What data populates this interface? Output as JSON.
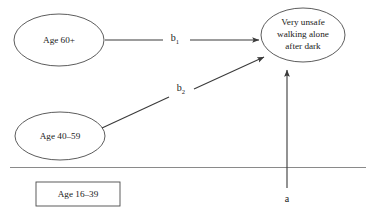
{
  "diagram": {
    "type": "path-diagram",
    "background_color": "#ffffff",
    "stroke_color": "#4a4a4a",
    "text_color": "#1a1a1a",
    "nodes": [
      {
        "id": "age-60-plus",
        "shape": "ellipse",
        "label": "Age 60+",
        "lines": [
          "Age 60+"
        ]
      },
      {
        "id": "age-40-59",
        "shape": "ellipse",
        "label": "Age 40–59",
        "lines": [
          "Age 40–59"
        ]
      },
      {
        "id": "age-16-39",
        "shape": "rectangle",
        "label": "Age 16–39",
        "lines": [
          "Age 16–39"
        ]
      },
      {
        "id": "outcome",
        "shape": "ellipse",
        "label": "Very unsafe walking alone after dark",
        "lines": [
          "Very unsafe",
          "walking alone",
          "after dark"
        ]
      }
    ],
    "edges": [
      {
        "id": "b1",
        "from": "age-60-plus",
        "to": "outcome",
        "label_base": "b",
        "label_sub": "1",
        "arrow": "end"
      },
      {
        "id": "b2",
        "from": "age-40-59",
        "to": "outcome",
        "label_base": "b",
        "label_sub": "2",
        "arrow": "end"
      },
      {
        "id": "a",
        "from": "baseline",
        "to": "outcome",
        "label_base": "a",
        "label_sub": "",
        "arrow": "end"
      }
    ]
  }
}
